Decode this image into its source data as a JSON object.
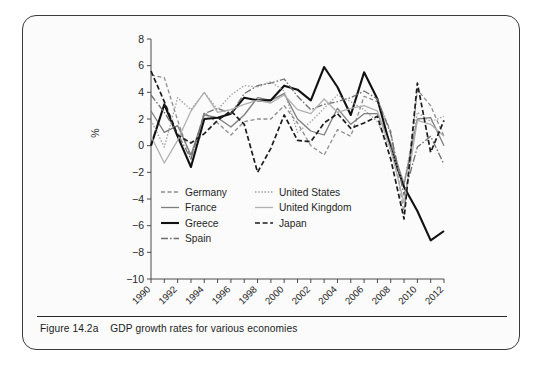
{
  "figure": {
    "caption_label": "Figure 14.2a",
    "caption_text": "GDP growth rates for various economies"
  },
  "chart_data": {
    "type": "line",
    "title": "",
    "xlabel": "",
    "ylabel": "%",
    "ylim": [
      -10,
      8
    ],
    "ytick_values": [
      8,
      6,
      4,
      2,
      0,
      -2,
      -4,
      -6,
      -8,
      -10
    ],
    "ytick_labels": [
      "8",
      "6",
      "4",
      "2",
      "0",
      "−2",
      "−4",
      "−6",
      "−8",
      "−10"
    ],
    "xlim": [
      1990,
      2012
    ],
    "x": [
      1990,
      1991,
      1992,
      1993,
      1994,
      1995,
      1996,
      1997,
      1998,
      1999,
      2000,
      2001,
      2002,
      2003,
      2004,
      2005,
      2006,
      2007,
      2008,
      2009,
      2010,
      2011,
      2012
    ],
    "xtick_values": [
      1990,
      1992,
      1994,
      1996,
      1998,
      2000,
      2002,
      2004,
      2006,
      2008,
      2010,
      2012
    ],
    "xtick_labels": [
      "1990",
      "1992",
      "1994",
      "1996",
      "1998",
      "2000",
      "2002",
      "2004",
      "2006",
      "2008",
      "2010",
      "2012"
    ],
    "xtick_rotation_deg": 45,
    "grid": false,
    "legend_position": "inside-lower-left",
    "legend_columns": 2,
    "series": [
      {
        "name": "Germany",
        "color": "#8c8c8c",
        "dash": "4,2.5",
        "width": 1.3,
        "values": [
          5.3,
          5.1,
          1.9,
          -1.0,
          2.5,
          1.7,
          0.8,
          1.8,
          2.0,
          2.0,
          3.0,
          1.7,
          0.0,
          -0.7,
          1.2,
          0.7,
          3.7,
          3.3,
          1.1,
          -5.1,
          4.2,
          3.0,
          0.7
        ]
      },
      {
        "name": "France",
        "color": "#7d7d7d",
        "dash": "none",
        "width": 1.3,
        "values": [
          2.6,
          1.0,
          1.5,
          -0.7,
          2.3,
          2.1,
          1.4,
          2.3,
          3.6,
          3.4,
          3.9,
          2.0,
          1.1,
          0.8,
          2.8,
          1.6,
          2.4,
          2.4,
          0.2,
          -2.9,
          2.0,
          2.1,
          0.0
        ]
      },
      {
        "name": "Greece",
        "color": "#111111",
        "dash": "none",
        "width": 2.1,
        "values": [
          0.0,
          3.1,
          0.7,
          -1.6,
          2.0,
          2.1,
          2.4,
          3.6,
          3.4,
          3.4,
          4.5,
          4.2,
          3.4,
          5.9,
          4.4,
          2.3,
          5.5,
          3.5,
          -0.2,
          -3.1,
          -4.9,
          -7.1,
          -6.4
        ]
      },
      {
        "name": "Spain",
        "color": "#6f6f6f",
        "dash": "7,2,1.6,2",
        "width": 1.3,
        "values": [
          3.8,
          2.5,
          0.9,
          -1.0,
          2.4,
          2.8,
          2.4,
          3.9,
          4.5,
          4.7,
          5.0,
          3.7,
          2.7,
          3.1,
          3.3,
          3.6,
          4.1,
          3.5,
          0.9,
          -3.7,
          -0.1,
          0.7,
          -1.4
        ]
      },
      {
        "name": "United States",
        "color": "#9a9a9a",
        "dash": "1.4,1.8",
        "width": 1.3,
        "values": [
          1.9,
          -0.1,
          3.6,
          2.7,
          4.0,
          2.7,
          3.8,
          4.5,
          4.4,
          4.8,
          4.1,
          1.0,
          1.8,
          2.8,
          3.8,
          3.3,
          2.7,
          1.8,
          -0.3,
          -2.8,
          2.5,
          1.8,
          2.2
        ]
      },
      {
        "name": "United Kingdom",
        "color": "#b0b0b0",
        "dash": "none",
        "width": 1.3,
        "values": [
          0.7,
          -1.3,
          0.4,
          2.6,
          4.0,
          2.5,
          2.7,
          3.1,
          3.4,
          3.2,
          3.8,
          2.7,
          2.4,
          3.5,
          2.5,
          2.8,
          3.0,
          2.6,
          -0.3,
          -4.3,
          1.9,
          1.6,
          0.7
        ]
      },
      {
        "name": "Japan",
        "color": "#1c1c1c",
        "dash": "5,2.6",
        "width": 1.7,
        "values": [
          5.6,
          3.3,
          0.8,
          0.2,
          0.9,
          1.9,
          2.6,
          1.6,
          -2.0,
          -0.2,
          2.3,
          0.4,
          0.3,
          1.7,
          2.4,
          1.3,
          1.7,
          2.2,
          -1.0,
          -5.5,
          4.7,
          -0.5,
          1.9
        ]
      }
    ]
  },
  "axes": {
    "y_axis_label": "%"
  }
}
